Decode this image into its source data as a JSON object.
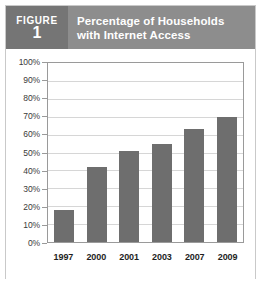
{
  "figure": {
    "badge_word": "FIGURE",
    "badge_number": "1",
    "title_line1": "Percentage of Households",
    "title_line2": "with Internet Access",
    "badge_bg": "#757575",
    "title_bg": "#8d8d8d",
    "title_color": "#ffffff"
  },
  "chart_data": {
    "type": "bar",
    "title": "Percentage of Households with Internet Access",
    "categories": [
      "1997",
      "2000",
      "2001",
      "2003",
      "2007",
      "2009"
    ],
    "values": [
      18,
      42,
      51,
      55,
      63,
      70
    ],
    "xlabel": "",
    "ylabel": "",
    "ylim": [
      0,
      100
    ],
    "ytick_step": 10,
    "ytick_labels": [
      "100%",
      "90%",
      "80%",
      "70%",
      "60%",
      "50%",
      "40%",
      "30%",
      "20%",
      "10%",
      "0%"
    ],
    "ytick_values": [
      100,
      90,
      80,
      70,
      60,
      50,
      40,
      30,
      20,
      10,
      0
    ],
    "grid": true,
    "legend": "none",
    "bar_color": "#6e6e6e",
    "gridline_color": "#d6d6d6",
    "axis_color": "#9a9a9a"
  }
}
